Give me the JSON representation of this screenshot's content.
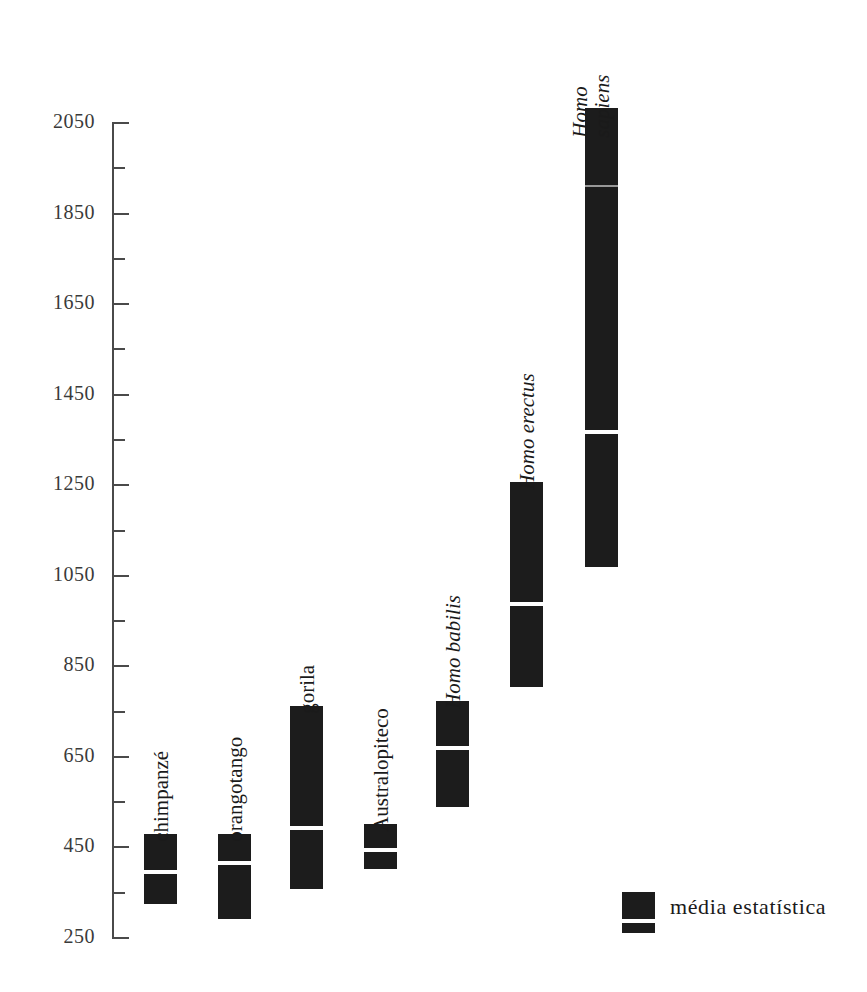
{
  "chart_data": {
    "type": "bar",
    "title": "",
    "subtitle": "",
    "xlabel": "",
    "ylabel": "",
    "ylim": [
      250,
      2050
    ],
    "y_major_step": 200,
    "y_minor_step": 100,
    "grid": false,
    "y_tick_labels": [
      "2050",
      "1850",
      "1650",
      "1450",
      "1250",
      "1050",
      "850",
      "650",
      "450",
      "250"
    ],
    "y_tick_values": [
      2050,
      1850,
      1650,
      1450,
      1250,
      1050,
      850,
      650,
      450,
      250
    ],
    "y_minor_tick_values": [
      1950,
      1750,
      1550,
      1350,
      1150,
      950,
      750,
      550,
      350
    ],
    "categories": [
      "chimpanzé",
      "orangotango",
      "gorila",
      "Australopiteco",
      "Homo babilis",
      "Homo erectus",
      "Homo sapiens"
    ],
    "series": [
      {
        "name": "range_min",
        "values": [
          325,
          292,
          358,
          403,
          540,
          805,
          1070
        ]
      },
      {
        "name": "mean",
        "values": [
          395,
          415,
          493,
          445,
          670,
          988,
          1367
        ]
      },
      {
        "name": "range_max",
        "values": [
          480,
          480,
          763,
          502,
          774,
          1258,
          2083
        ]
      }
    ],
    "bars": [
      {
        "category": "chimpanzé",
        "italic": false,
        "two_line": false,
        "min": 325,
        "mean": 395,
        "max": 480
      },
      {
        "category": "orangotango",
        "italic": false,
        "two_line": false,
        "min": 292,
        "mean": 415,
        "max": 480
      },
      {
        "category": "gorila",
        "italic": false,
        "two_line": false,
        "min": 358,
        "mean": 493,
        "max": 763
      },
      {
        "category": "Australopiteco",
        "italic": false,
        "two_line": false,
        "min": 403,
        "mean": 445,
        "max": 502
      },
      {
        "category": "Homo babilis",
        "italic": true,
        "two_line": false,
        "min": 540,
        "mean": 670,
        "max": 774
      },
      {
        "category": "Homo erectus",
        "italic": true,
        "two_line": false,
        "min": 805,
        "mean": 988,
        "max": 1258
      },
      {
        "category": "Homo sapiens",
        "italic": true,
        "two_line": true,
        "min": 1070,
        "mean": 1367,
        "max": 2083
      }
    ],
    "legend": {
      "position": "bottom-right",
      "entries": [
        {
          "label": "média estatística",
          "marker": "bar-with-white-mean-line"
        }
      ]
    },
    "colors": {
      "bar_fill": "#1c1c1c",
      "mean_line": "#ffffff",
      "axis": "#4a4a4a",
      "text": "#1a1a1a",
      "tick_label": "#3a3a3a",
      "background": "#ffffff"
    },
    "annotations": []
  },
  "layout": {
    "axis_x": 112,
    "axis_top_y": 123,
    "axis_bottom_y": 938,
    "bar_width": 33,
    "bar_x_positions": [
      144,
      218,
      290,
      364,
      436,
      510,
      585
    ],
    "label_offsets_y": [
      -16,
      -16,
      -16,
      -16,
      -16,
      -16,
      -16
    ]
  },
  "legend_block": {
    "label": "média estatística"
  }
}
